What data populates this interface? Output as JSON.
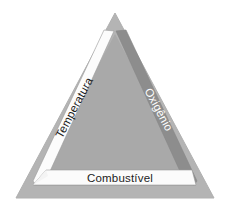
{
  "figure": {
    "name": "fire-triangle",
    "background_color": "#ffffff",
    "width": 229,
    "height": 215
  },
  "diagram": {
    "shape": "triangle",
    "outer_border_color": "#b3b3b3",
    "inner_fill_color": "#a9a9a9",
    "right_band_color": "#8d8d8d",
    "left_band_color": "#fdfdfd",
    "bottom_band_color": "#fbfbfb",
    "outline_color": "#8a8a8a",
    "elements": [
      {
        "id": "temperatura",
        "label": "Temperatura",
        "side": "left",
        "text_color": "#1c1c1c",
        "band_color": "#fdfdfd",
        "rotation_deg": -62
      },
      {
        "id": "oxigenio",
        "label": "Oxigênio",
        "side": "right",
        "text_color": "#ffffff",
        "band_color": "#8d8d8d",
        "rotation_deg": 62
      },
      {
        "id": "combustivel",
        "label": "Combustível",
        "side": "bottom",
        "text_color": "#1c1c1c",
        "band_color": "#fbfbfb",
        "rotation_deg": 0
      }
    ]
  }
}
